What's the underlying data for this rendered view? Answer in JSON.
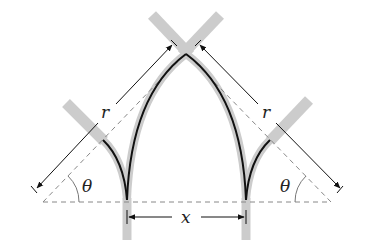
{
  "diagram": {
    "labels": {
      "r_left": "r",
      "r_right": "r",
      "theta_left": "θ",
      "theta_right": "θ",
      "x": "x"
    },
    "colors": {
      "arch_line": "#111111",
      "dimension_line": "#111111",
      "dashed_line": "#888888",
      "member_band": "#cccccc",
      "text": "#222222"
    }
  }
}
